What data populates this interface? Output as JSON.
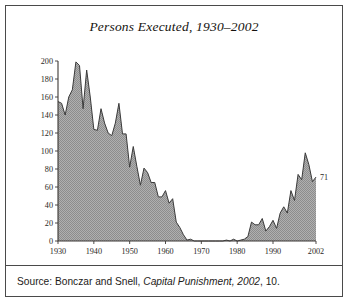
{
  "figure": {
    "title": "Persons Executed, 1930–2002",
    "source_prefix": "Source: Bonczar and Snell, ",
    "source_italic": "Capital Punishment, 2002",
    "source_suffix": ", 10."
  },
  "colors": {
    "fill": "#a8a8a8",
    "line": "#3a3a3a",
    "grid": "#ffffff",
    "axis": "#3c3936",
    "border": "#4a4a4a",
    "text": "#15130f"
  },
  "annotations": {
    "final_value_label": "71"
  },
  "chart_data": {
    "type": "area",
    "title": "Persons Executed, 1930–2002",
    "xlabel": "",
    "ylabel": "",
    "xlim": [
      1930,
      2002
    ],
    "ylim": [
      0,
      200
    ],
    "grid": true,
    "legend": "none",
    "xticks": [
      1930,
      1940,
      1950,
      1960,
      1970,
      1980,
      1990,
      2002
    ],
    "xtick_labels": [
      "1930",
      "1940",
      "1950",
      "1960",
      "1970",
      "1980",
      "1990",
      "2002"
    ],
    "yticks": [
      0,
      20,
      40,
      60,
      80,
      100,
      120,
      140,
      160,
      180,
      200
    ],
    "ytick_labels": [
      "0",
      "20",
      "40",
      "60",
      "80",
      "100",
      "120",
      "140",
      "160",
      "180",
      "200"
    ],
    "annotations": [
      {
        "x": 2002,
        "y": 71,
        "text": "71"
      }
    ],
    "x": [
      1930,
      1931,
      1932,
      1933,
      1934,
      1935,
      1936,
      1937,
      1938,
      1939,
      1940,
      1941,
      1942,
      1943,
      1944,
      1945,
      1946,
      1947,
      1948,
      1949,
      1950,
      1951,
      1952,
      1953,
      1954,
      1955,
      1956,
      1957,
      1958,
      1959,
      1960,
      1961,
      1962,
      1963,
      1964,
      1965,
      1966,
      1967,
      1968,
      1969,
      1970,
      1971,
      1972,
      1973,
      1974,
      1975,
      1976,
      1977,
      1978,
      1979,
      1980,
      1981,
      1982,
      1983,
      1984,
      1985,
      1986,
      1987,
      1988,
      1989,
      1990,
      1991,
      1992,
      1993,
      1994,
      1995,
      1996,
      1997,
      1998,
      1999,
      2000,
      2001,
      2002
    ],
    "values": [
      155,
      153,
      140,
      160,
      168,
      199,
      195,
      147,
      190,
      160,
      124,
      123,
      147,
      131,
      120,
      117,
      131,
      153,
      119,
      119,
      82,
      105,
      83,
      62,
      81,
      76,
      65,
      65,
      49,
      49,
      56,
      42,
      47,
      21,
      15,
      7,
      1,
      2,
      0,
      0,
      0,
      0,
      0,
      0,
      0,
      0,
      0,
      1,
      0,
      2,
      0,
      1,
      2,
      5,
      21,
      18,
      18,
      25,
      11,
      16,
      23,
      14,
      31,
      38,
      31,
      56,
      45,
      74,
      68,
      98,
      85,
      66,
      71
    ],
    "series": [
      {
        "name": "Persons executed",
        "values": [
          155,
          153,
          140,
          160,
          168,
          199,
          195,
          147,
          190,
          160,
          124,
          123,
          147,
          131,
          120,
          117,
          131,
          153,
          119,
          119,
          82,
          105,
          83,
          62,
          81,
          76,
          65,
          65,
          49,
          49,
          56,
          42,
          47,
          21,
          15,
          7,
          1,
          2,
          0,
          0,
          0,
          0,
          0,
          0,
          0,
          0,
          0,
          1,
          0,
          2,
          0,
          1,
          2,
          5,
          21,
          18,
          18,
          25,
          11,
          16,
          23,
          14,
          31,
          38,
          31,
          56,
          45,
          74,
          68,
          98,
          85,
          66,
          71
        ]
      }
    ]
  }
}
